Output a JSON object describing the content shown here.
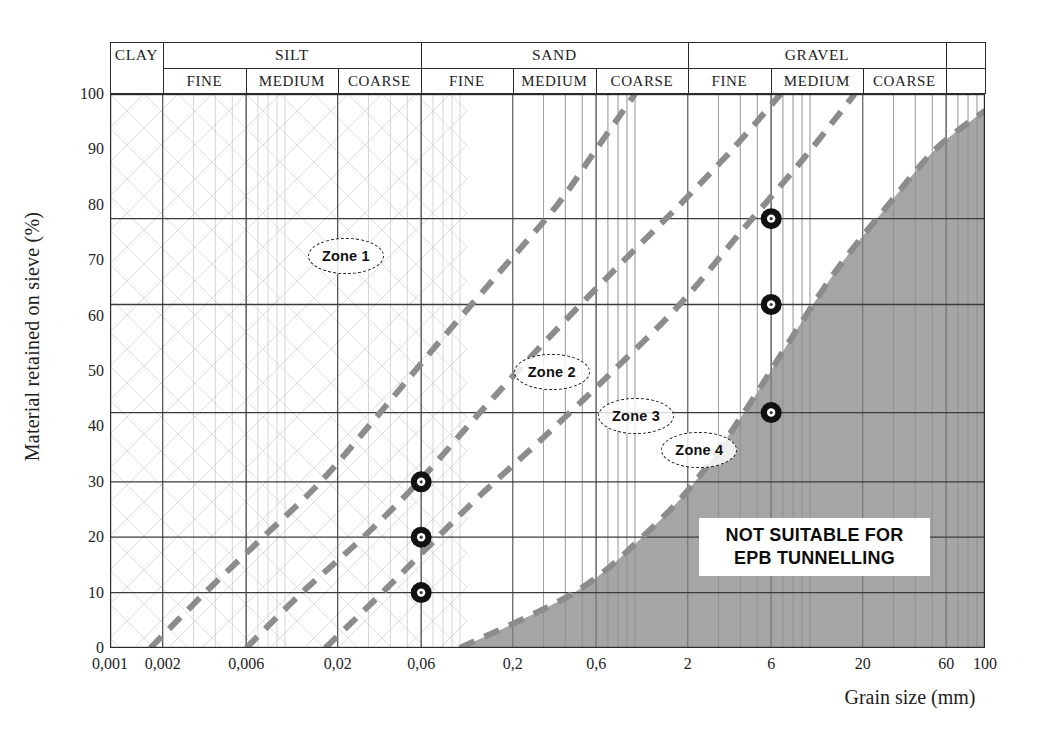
{
  "chart_data": {
    "type": "line",
    "title": "",
    "xlabel": "Grain size (mm)",
    "ylabel": "Material retained on sieve (%)",
    "xscale": "log",
    "xlim": [
      0.001,
      100
    ],
    "ylim": [
      0,
      100
    ],
    "grid": true,
    "legend": "none",
    "xticks": [
      "0,001",
      "0,002",
      "0,006",
      "0,02",
      "0,06",
      "0,2",
      "0,6",
      "2",
      "6",
      "20",
      "60",
      "100"
    ],
    "xtick_values": [
      0.001,
      0.002,
      0.006,
      0.02,
      0.06,
      0.2,
      0.6,
      2,
      6,
      20,
      60,
      100
    ],
    "yticks": [
      "0",
      "10",
      "20",
      "30",
      "40",
      "50",
      "60",
      "70",
      "80",
      "90",
      "100"
    ],
    "ytick_values": [
      0,
      10,
      20,
      30,
      40,
      50,
      60,
      70,
      80,
      90,
      100
    ],
    "soil_classes": [
      {
        "name": "CLAY",
        "from": 0.001,
        "to": 0.002,
        "sub": []
      },
      {
        "name": "SILT",
        "from": 0.002,
        "to": 0.06,
        "sub": [
          {
            "name": "FINE",
            "from": 0.002,
            "to": 0.006
          },
          {
            "name": "MEDIUM",
            "from": 0.006,
            "to": 0.02
          },
          {
            "name": "COARSE",
            "from": 0.02,
            "to": 0.06
          }
        ]
      },
      {
        "name": "SAND",
        "from": 0.06,
        "to": 2,
        "sub": [
          {
            "name": "FINE",
            "from": 0.06,
            "to": 0.2
          },
          {
            "name": "MEDIUM",
            "from": 0.2,
            "to": 0.6
          },
          {
            "name": "COARSE",
            "from": 0.6,
            "to": 2
          }
        ]
      },
      {
        "name": "GRAVEL",
        "from": 2,
        "to": 60,
        "sub": [
          {
            "name": "FINE",
            "from": 2,
            "to": 6
          },
          {
            "name": "MEDIUM",
            "from": 6,
            "to": 20
          },
          {
            "name": "COARSE",
            "from": 20,
            "to": 60
          }
        ]
      },
      {
        "name": "",
        "from": 60,
        "to": 100,
        "sub": []
      }
    ],
    "series": [
      {
        "name": "Zone 1 / Zone 2 boundary",
        "style": "dashed-grey",
        "points": [
          [
            0.0017,
            0
          ],
          [
            0.0035,
            10
          ],
          [
            0.0075,
            20
          ],
          [
            0.016,
            30
          ],
          [
            0.035,
            42.5
          ],
          [
            0.075,
            55
          ],
          [
            0.17,
            68
          ],
          [
            0.36,
            80
          ],
          [
            0.6,
            90
          ],
          [
            1.0,
            100
          ]
        ]
      },
      {
        "name": "Zone 2 / Zone 3 boundary",
        "style": "dashed-grey",
        "points": [
          [
            0.006,
            0
          ],
          [
            0.0125,
            10
          ],
          [
            0.028,
            20
          ],
          [
            0.058,
            30
          ],
          [
            0.13,
            42.5
          ],
          [
            0.3,
            55
          ],
          [
            0.75,
            68
          ],
          [
            1.8,
            80
          ],
          [
            3.6,
            90
          ],
          [
            6.8,
            100
          ]
        ]
      },
      {
        "name": "Zone 3 / Zone 4 boundary",
        "style": "dashed-grey",
        "points": [
          [
            0.017,
            0
          ],
          [
            0.036,
            10
          ],
          [
            0.06,
            17
          ],
          [
            0.125,
            27
          ],
          [
            0.3,
            38
          ],
          [
            0.75,
            50
          ],
          [
            1.8,
            62
          ],
          [
            4.0,
            75
          ],
          [
            9.0,
            88
          ],
          [
            18,
            100
          ]
        ]
      },
      {
        "name": "Not suitable boundary",
        "style": "dashed-grey-filled",
        "points": [
          [
            0.1,
            0
          ],
          [
            0.45,
            10
          ],
          [
            1.1,
            20
          ],
          [
            2.2,
            30
          ],
          [
            4.2,
            42.5
          ],
          [
            7.5,
            55
          ],
          [
            14,
            68
          ],
          [
            28,
            80
          ],
          [
            52,
            90
          ],
          [
            100,
            97
          ]
        ]
      }
    ],
    "markers": [
      {
        "label": "",
        "x": 0.06,
        "y": 30
      },
      {
        "label": "",
        "x": 0.06,
        "y": 20
      },
      {
        "label": "",
        "x": 0.06,
        "y": 10
      },
      {
        "label": "",
        "x": 6,
        "y": 77.5
      },
      {
        "label": "",
        "x": 6,
        "y": 62
      },
      {
        "label": "",
        "x": 6,
        "y": 42.5
      }
    ],
    "reference_lines_y": [
      77.5,
      62,
      42.5,
      30,
      20,
      10
    ],
    "annotations": [
      {
        "text": "Zone 1",
        "x": 0.022,
        "y": 71
      },
      {
        "text": "Zone 2",
        "x": 0.33,
        "y": 50
      },
      {
        "text": "Zone 3",
        "x": 1.0,
        "y": 42
      },
      {
        "text": "Zone 4",
        "x": 2.3,
        "y": 36
      },
      {
        "text": "NOT SUITABLE FOR EPB TUNNELLING",
        "x": 20,
        "y": 20
      }
    ],
    "not_suitable_label": {
      "line1": "NOT SUITABLE FOR",
      "line2": "EPB TUNNELLING"
    },
    "colors": {
      "dashed_curve": "#8c8c8c",
      "shaded_region": "#a0a0a0",
      "axis": "#2b2b2b",
      "grid_major": "#595959",
      "grid_minor": "#c9c9c9",
      "marker_ring": "#111111",
      "text": "#1d1d1d"
    }
  }
}
